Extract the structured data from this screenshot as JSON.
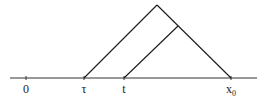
{
  "diagram": {
    "type": "characteristic-cone",
    "axis": {
      "y": 78,
      "x_start": 10,
      "x_end": 257,
      "color": "#333333"
    },
    "ticks": [
      {
        "x": 26,
        "label": "0",
        "sub": ""
      },
      {
        "x": 84,
        "label": "τ",
        "sub": ""
      },
      {
        "x": 124,
        "label": "t",
        "sub": ""
      },
      {
        "x": 231,
        "label": "x",
        "sub": "0"
      }
    ],
    "lines": [
      {
        "name": "outer-left-edge",
        "x1": 84,
        "y1": 78,
        "x2": 157,
        "y2": 5
      },
      {
        "name": "outer-right-edge",
        "x1": 157,
        "y1": 5,
        "x2": 231,
        "y2": 78
      },
      {
        "name": "inner-edge",
        "x1": 124,
        "y1": 78,
        "x2": 178,
        "y2": 26
      }
    ],
    "line_color": "#1a1a1a"
  }
}
